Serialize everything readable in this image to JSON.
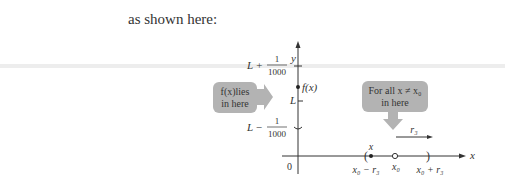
{
  "intro_text": "as shown here:",
  "figure": {
    "axes": {
      "y_label": "y",
      "x_label": "x",
      "origin_label": "0"
    },
    "y_ticks": {
      "upper": {
        "prefix": "L +",
        "numerator": "1",
        "denominator": "1000"
      },
      "middle": {
        "label": "L"
      },
      "lower": {
        "prefix": "L −",
        "numerator": "1",
        "denominator": "1000"
      }
    },
    "point_label": "f(x)",
    "left_callout": {
      "line1": "f(x)lies",
      "line2": "in here"
    },
    "right_callout": {
      "line1": "For all  x ≠ x₀",
      "line2": "in here"
    },
    "radius_label": "r₃",
    "x_marks": {
      "point_label": "x",
      "left_bound": "x₀ − r₃",
      "center": "x₀",
      "right_bound": "x₀ + r₃"
    },
    "colors": {
      "callout_fill": "#b3b3b3",
      "axis": "#333333",
      "band": "#d9d9d9"
    }
  }
}
